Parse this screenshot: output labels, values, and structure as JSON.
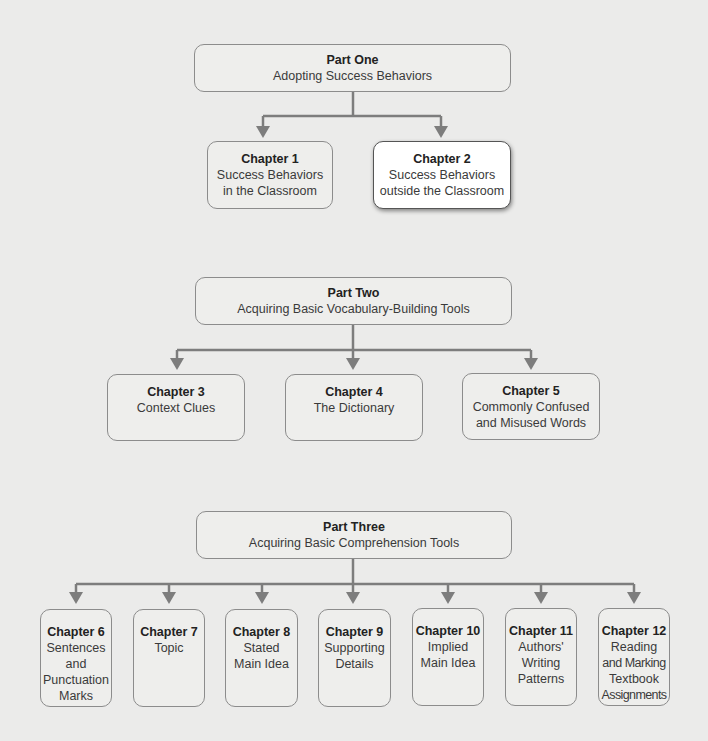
{
  "parts": [
    {
      "title": "Part One",
      "subtitle": "Adopting Success Behaviors",
      "chapters": [
        {
          "title": "Chapter 1",
          "lines": [
            "Success Behaviors",
            "in the Classroom"
          ]
        },
        {
          "title": "Chapter 2",
          "lines": [
            "Success Behaviors",
            "outside the Classroom"
          ],
          "highlighted": true
        }
      ]
    },
    {
      "title": "Part Two",
      "subtitle": "Acquiring Basic Vocabulary-Building Tools",
      "chapters": [
        {
          "title": "Chapter 3",
          "lines": [
            "Context Clues"
          ]
        },
        {
          "title": "Chapter 4",
          "lines": [
            "The Dictionary"
          ]
        },
        {
          "title": "Chapter 5",
          "lines": [
            "Commonly Confused",
            "and Misused Words"
          ]
        }
      ]
    },
    {
      "title": "Part Three",
      "subtitle": "Acquiring Basic Comprehension Tools",
      "chapters": [
        {
          "title": "Chapter 6",
          "lines": [
            "Sentences",
            "and",
            "Punctuation",
            "Marks"
          ]
        },
        {
          "title": "Chapter 7",
          "lines": [
            "Topic"
          ]
        },
        {
          "title": "Chapter 8",
          "lines": [
            "Stated",
            "Main Idea"
          ]
        },
        {
          "title": "Chapter 9",
          "lines": [
            "Supporting",
            "Details"
          ]
        },
        {
          "title": "Chapter 10",
          "lines": [
            "Implied",
            "Main Idea"
          ]
        },
        {
          "title": "Chapter 11",
          "lines": [
            "Authors'",
            "Writing",
            "Patterns"
          ]
        },
        {
          "title": "Chapter 12",
          "lines": [
            "Reading",
            "and Marking",
            "Textbook",
            "Assignments"
          ]
        }
      ]
    }
  ],
  "colors": {
    "background": "#ebebea",
    "box_fill": "#eeeeec",
    "box_border": "#8c8c8c",
    "connector": "#7d7d7d",
    "highlight_fill": "#ffffff"
  }
}
